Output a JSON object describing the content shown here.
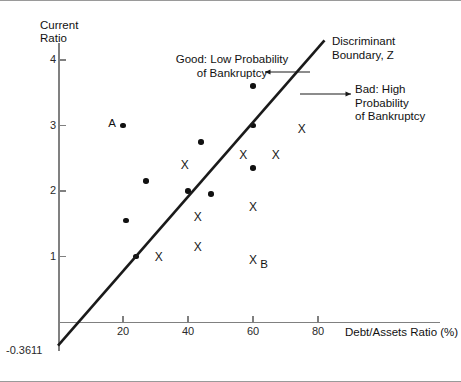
{
  "chart_data": {
    "type": "scatter",
    "title": "",
    "xlabel": "Debt/Assets Ratio (%)",
    "ylabel": "Current\nRatio",
    "xlim": [
      0,
      100
    ],
    "ylim": [
      -0.45,
      4.35
    ],
    "xticks": [
      "20",
      "40",
      "60",
      "80"
    ],
    "xtick_values": [
      20,
      40,
      60,
      80
    ],
    "yticks": [
      "1",
      "2",
      "3",
      "4"
    ],
    "ytick_values": [
      1,
      2,
      3,
      4
    ],
    "grid": false,
    "legend_position": "none",
    "series": [
      {
        "name": "Good: Low Probability of Bankruptcy",
        "marker": "dot",
        "points": [
          {
            "x": 20,
            "y": 3.0,
            "label": "A"
          },
          {
            "x": 27,
            "y": 2.15,
            "label": ""
          },
          {
            "x": 21,
            "y": 1.55,
            "label": ""
          },
          {
            "x": 24,
            "y": 1.0,
            "label": ""
          },
          {
            "x": 44,
            "y": 2.75,
            "label": ""
          },
          {
            "x": 40,
            "y": 2.0,
            "label": ""
          },
          {
            "x": 47,
            "y": 1.95,
            "label": ""
          },
          {
            "x": 60,
            "y": 3.6,
            "label": ""
          },
          {
            "x": 60,
            "y": 3.0,
            "label": ""
          },
          {
            "x": 60,
            "y": 2.35,
            "label": ""
          }
        ]
      },
      {
        "name": "Bad: High Probability of Bankruptcy",
        "marker": "x",
        "points": [
          {
            "x": 31,
            "y": 1.0,
            "label": ""
          },
          {
            "x": 39,
            "y": 2.4,
            "label": ""
          },
          {
            "x": 43,
            "y": 1.6,
            "label": ""
          },
          {
            "x": 43,
            "y": 1.15,
            "label": ""
          },
          {
            "x": 57,
            "y": 2.55,
            "label": ""
          },
          {
            "x": 67,
            "y": 2.55,
            "label": ""
          },
          {
            "x": 60,
            "y": 1.75,
            "label": ""
          },
          {
            "x": 60,
            "y": 0.95,
            "label": "B"
          },
          {
            "x": 75,
            "y": 2.95,
            "label": ""
          }
        ]
      }
    ],
    "boundary_line": {
      "name": "Discriminant Boundary, Z",
      "x_start": 0,
      "y_start": -0.3611,
      "x_end": 82,
      "y_end": 4.3,
      "intercept_label": "-0.3611"
    },
    "annotations": [
      {
        "name": "good-region",
        "text": "Good: Low Probability\nof Bankruptcy"
      },
      {
        "name": "bad-region",
        "text": "Bad: High Probability\nof Bankruptcy"
      },
      {
        "name": "boundary",
        "text": "Discriminant\nBoundary, Z"
      }
    ]
  },
  "axes": {
    "y_title": "Current\nRatio",
    "x_title": "Debt/Assets Ratio (%)",
    "intercept": "-0.3611",
    "yticks": [
      "1",
      "2",
      "3",
      "4"
    ],
    "xticks": [
      "20",
      "40",
      "60",
      "80"
    ]
  },
  "annotations": {
    "good": "Good: Low Probability\nof Bankruptcy",
    "bad": "Bad: High Probability\nof Bankruptcy",
    "boundary": "Discriminant\nBoundary, Z"
  }
}
